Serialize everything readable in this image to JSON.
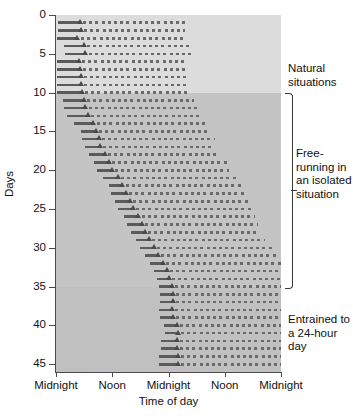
{
  "figure": {
    "type": "actogram",
    "title": "",
    "background_color": "#c9c9c9"
  },
  "axes": {
    "y": {
      "label": "Days",
      "ticks": [
        "0",
        "5",
        "10",
        "15",
        "20",
        "25",
        "30",
        "35",
        "40",
        "45"
      ],
      "min": 0,
      "max": 46,
      "direction": "top-to-bottom"
    },
    "x": {
      "label": "Time of day",
      "ticks": [
        "Midnight",
        "Noon",
        "Midnight",
        "Noon",
        "Midnight"
      ],
      "tick_hours": [
        0,
        12,
        24,
        36,
        48
      ],
      "min_hour": 0,
      "max_hour": 48
    }
  },
  "annotations": [
    {
      "id": "natural",
      "text": "Natural situations",
      "day_start": 0,
      "day_end": 10,
      "bracket": false
    },
    {
      "id": "free-running",
      "text": "Free-running in an isolated situation",
      "day_start": 10,
      "day_end": 35,
      "bracket": true
    },
    {
      "id": "entrained",
      "text": "Entrained to a 24-hour day",
      "day_start": 35,
      "day_end": 46,
      "bracket": false
    }
  ],
  "bands": [
    {
      "id": "natural",
      "day_start": 0,
      "day_end": 10,
      "color": "#dcdcdc"
    },
    {
      "id": "free-running",
      "day_start": 10,
      "day_end": 35,
      "color": "#c4c4c4"
    },
    {
      "id": "entrained",
      "day_start": 35,
      "day_end": 46,
      "color": "#c0c0c0"
    }
  ],
  "chart_data": {
    "type": "actogram",
    "title": "",
    "xlabel": "Time of day",
    "ylabel": "Days",
    "xlim": [
      0,
      48
    ],
    "ylim": [
      0,
      46
    ],
    "xticks": [
      0,
      12,
      24,
      36,
      48
    ],
    "xticklabels": [
      "Midnight",
      "Noon",
      "Midnight",
      "Noon",
      "Midnight"
    ],
    "yticks": [
      0,
      5,
      10,
      15,
      20,
      25,
      30,
      35,
      40,
      45
    ],
    "grid": false,
    "legend": "none",
    "series_description": "Each row = one day. Solid bar precedes activity-onset triangle marker; dotted bar follows, marking the activity span.",
    "rows": [
      {
        "day": 1,
        "solid_start": 0.4,
        "onset": 5.2,
        "dotted_end": 28.0
      },
      {
        "day": 2,
        "solid_start": 0.4,
        "onset": 5.4,
        "dotted_end": 27.5
      },
      {
        "day": 3,
        "solid_start": 0.2,
        "onset": 4.6,
        "dotted_end": 27.5
      },
      {
        "day": 4,
        "solid_start": 1.6,
        "onset": 6.0,
        "dotted_end": 29.0
      },
      {
        "day": 5,
        "solid_start": 2.0,
        "onset": 6.3,
        "dotted_end": 29.5
      },
      {
        "day": 6,
        "solid_start": 0.2,
        "onset": 5.0,
        "dotted_end": 28.0
      },
      {
        "day": 7,
        "solid_start": 0.2,
        "onset": 5.1,
        "dotted_end": 28.0
      },
      {
        "day": 8,
        "solid_start": 0.2,
        "onset": 5.3,
        "dotted_end": 28.0
      },
      {
        "day": 9,
        "solid_start": 0.2,
        "onset": 5.4,
        "dotted_end": 28.0
      },
      {
        "day": 10,
        "solid_start": 0.2,
        "onset": 5.5,
        "dotted_end": 28.5
      },
      {
        "day": 11,
        "solid_start": 1.4,
        "onset": 5.9,
        "dotted_end": 29.5
      },
      {
        "day": 12,
        "solid_start": 1.6,
        "onset": 6.3,
        "dotted_end": 30.5
      },
      {
        "day": 13,
        "solid_start": 2.4,
        "onset": 6.8,
        "dotted_end": 31.0
      },
      {
        "day": 14,
        "solid_start": 3.8,
        "onset": 8.0,
        "dotted_end": 32.0
      },
      {
        "day": 15,
        "solid_start": 5.4,
        "onset": 8.6,
        "dotted_end": 32.5
      },
      {
        "day": 16,
        "solid_start": 5.6,
        "onset": 9.1,
        "dotted_end": 34.0
      },
      {
        "day": 17,
        "solid_start": 6.1,
        "onset": 9.4,
        "dotted_end": 33.5
      },
      {
        "day": 18,
        "solid_start": 7.0,
        "onset": 10.4,
        "dotted_end": 35.0
      },
      {
        "day": 19,
        "solid_start": 8.0,
        "onset": 11.4,
        "dotted_end": 36.5
      },
      {
        "day": 20,
        "solid_start": 8.8,
        "onset": 12.0,
        "dotted_end": 37.0
      },
      {
        "day": 21,
        "solid_start": 10.0,
        "onset": 13.2,
        "dotted_end": 38.5
      },
      {
        "day": 22,
        "solid_start": 11.2,
        "onset": 14.2,
        "dotted_end": 39.5
      },
      {
        "day": 23,
        "solid_start": 11.8,
        "onset": 14.9,
        "dotted_end": 40.5
      },
      {
        "day": 24,
        "solid_start": 12.6,
        "onset": 15.8,
        "dotted_end": 41.0
      },
      {
        "day": 25,
        "solid_start": 13.2,
        "onset": 16.4,
        "dotted_end": 41.5
      },
      {
        "day": 26,
        "solid_start": 14.6,
        "onset": 17.6,
        "dotted_end": 42.5
      },
      {
        "day": 27,
        "solid_start": 15.2,
        "onset": 18.3,
        "dotted_end": 43.0
      },
      {
        "day": 28,
        "solid_start": 16.0,
        "onset": 19.0,
        "dotted_end": 43.5
      },
      {
        "day": 29,
        "solid_start": 17.0,
        "onset": 19.8,
        "dotted_end": 44.5
      },
      {
        "day": 30,
        "solid_start": 18.0,
        "onset": 20.9,
        "dotted_end": 46.0
      },
      {
        "day": 31,
        "solid_start": 19.0,
        "onset": 21.8,
        "dotted_end": 47.0
      },
      {
        "day": 32,
        "solid_start": 20.0,
        "onset": 22.8,
        "dotted_end": 48.0
      },
      {
        "day": 33,
        "solid_start": 21.0,
        "onset": 23.6,
        "dotted_end": 48.0
      },
      {
        "day": 34,
        "solid_start": 21.6,
        "onset": 24.2,
        "dotted_end": 48.0
      },
      {
        "day": 35,
        "solid_start": 22.0,
        "onset": 24.8,
        "dotted_end": 48.0
      },
      {
        "day": 36,
        "solid_start": 22.2,
        "onset": 25.0,
        "dotted_end": 48.0
      },
      {
        "day": 37,
        "solid_start": 22.2,
        "onset": 25.0,
        "dotted_end": 48.0
      },
      {
        "day": 38,
        "solid_start": 22.0,
        "onset": 24.8,
        "dotted_end": 48.0
      },
      {
        "day": 39,
        "solid_start": 22.2,
        "onset": 25.0,
        "dotted_end": 48.0
      },
      {
        "day": 40,
        "solid_start": 23.0,
        "onset": 25.8,
        "dotted_end": 48.0
      },
      {
        "day": 41,
        "solid_start": 23.2,
        "onset": 26.0,
        "dotted_end": 48.0
      },
      {
        "day": 42,
        "solid_start": 22.4,
        "onset": 25.8,
        "dotted_end": 48.0
      },
      {
        "day": 43,
        "solid_start": 22.4,
        "onset": 25.9,
        "dotted_end": 48.0
      },
      {
        "day": 44,
        "solid_start": 22.0,
        "onset": 26.0,
        "dotted_end": 48.0
      },
      {
        "day": 45,
        "solid_start": 22.0,
        "onset": 26.0,
        "dotted_end": 48.0
      }
    ]
  }
}
